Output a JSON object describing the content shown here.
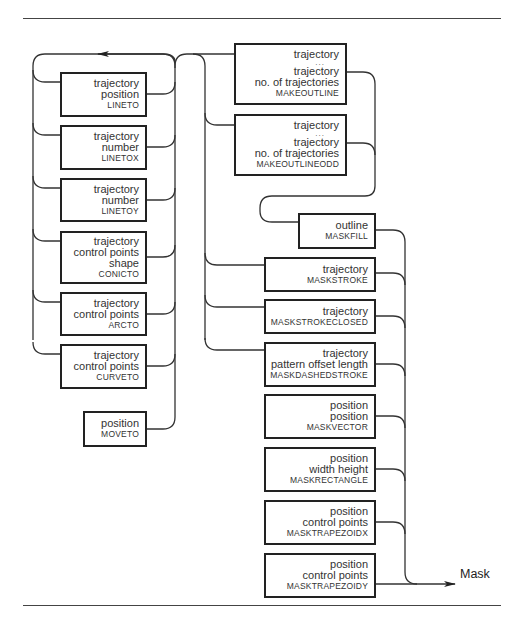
{
  "diagram": {
    "type": "syntax-flow",
    "output_label": "Mask",
    "left_column": [
      {
        "id": "lineto",
        "args": [
          "trajectory",
          "position"
        ],
        "op": "LINETO"
      },
      {
        "id": "linetox",
        "args": [
          "trajectory",
          "number"
        ],
        "op": "LINETOX"
      },
      {
        "id": "linetoy",
        "args": [
          "trajectory",
          "number"
        ],
        "op": "LINETOY"
      },
      {
        "id": "conicto",
        "args": [
          "trajectory",
          "control points",
          "shape"
        ],
        "op": "CONICTO"
      },
      {
        "id": "arcto",
        "args": [
          "trajectory",
          "control points"
        ],
        "op": "ARCTO"
      },
      {
        "id": "curveto",
        "args": [
          "trajectory",
          "control points"
        ],
        "op": "CURVETO"
      },
      {
        "id": "moveto",
        "args": [
          "position"
        ],
        "op": "MOVETO"
      }
    ],
    "outline_column": [
      {
        "id": "makeoutline",
        "args": [
          "trajectory",
          "...",
          "trajectory",
          "no. of trajectories"
        ],
        "op": "MAKEOUTLINE"
      },
      {
        "id": "makeoutlineodd",
        "args": [
          "trajectory",
          "...",
          "trajectory",
          "no. of trajectories"
        ],
        "op": "MAKEOUTLINEODD"
      }
    ],
    "mask_column": [
      {
        "id": "maskfill",
        "args": [
          "outline"
        ],
        "op": "MASKFILL"
      },
      {
        "id": "maskstroke",
        "args": [
          "trajectory"
        ],
        "op": "MASKSTROKE"
      },
      {
        "id": "maskstrokeclosed",
        "args": [
          "trajectory"
        ],
        "op": "MASKSTROKECLOSED"
      },
      {
        "id": "maskdashedstroke",
        "args": [
          "trajectory",
          "pattern offset length"
        ],
        "op": "MASKDASHEDSTROKE"
      },
      {
        "id": "maskvector",
        "args": [
          "position",
          "position"
        ],
        "op": "MASKVECTOR"
      },
      {
        "id": "maskrectangle",
        "args": [
          "position",
          "width height"
        ],
        "op": "MASKRECTANGLE"
      },
      {
        "id": "masktrapezoidx",
        "args": [
          "position",
          "control points"
        ],
        "op": "MASKTRAPEZOIDX"
      },
      {
        "id": "masktrapezoidy",
        "args": [
          "position",
          "control points"
        ],
        "op": "MASKTRAPEZOIDY"
      }
    ]
  }
}
